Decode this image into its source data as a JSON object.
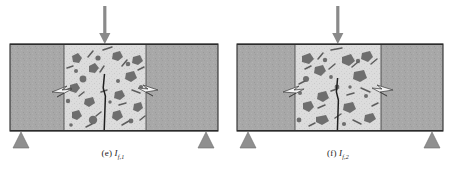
{
  "figure": {
    "type": "diagram",
    "panels": [
      {
        "id": "panel-e",
        "caption_index": "(e)",
        "caption_symbol": "I",
        "caption_subscript": "f,1",
        "caption_full": "(e) If,1",
        "load_arrow": {
          "direction": "down",
          "label": ""
        },
        "supports": [
          "left-triangle-support",
          "right-triangle-support"
        ],
        "zones": [
          "left-end-block",
          "concrete-aggregate-zone",
          "right-end-block"
        ],
        "cracks": [
          "central-vertical-crack",
          "left-interface-crack",
          "right-interface-crack"
        ]
      },
      {
        "id": "panel-f",
        "caption_index": "(f)",
        "caption_symbol": "I",
        "caption_subscript": "f,2",
        "caption_full": "(f) If,2",
        "load_arrow": {
          "direction": "down",
          "label": ""
        },
        "supports": [
          "left-triangle-support",
          "right-triangle-support"
        ],
        "zones": [
          "left-end-block",
          "concrete-aggregate-zone",
          "right-end-block"
        ],
        "cracks": [
          "central-vertical-crack",
          "left-interface-crack",
          "right-interface-crack"
        ]
      }
    ],
    "colors": {
      "end_block_fill": "#a8a8a8",
      "concrete_fill": "#d9d9d9",
      "aggregate_fill": "#6e6e6e",
      "outline": "#2b2b2b",
      "arrow_fill": "#8a8a8a",
      "support_fill": "#8f8f8f",
      "background": "#ffffff",
      "caption_text": "#1a1a1a"
    }
  }
}
